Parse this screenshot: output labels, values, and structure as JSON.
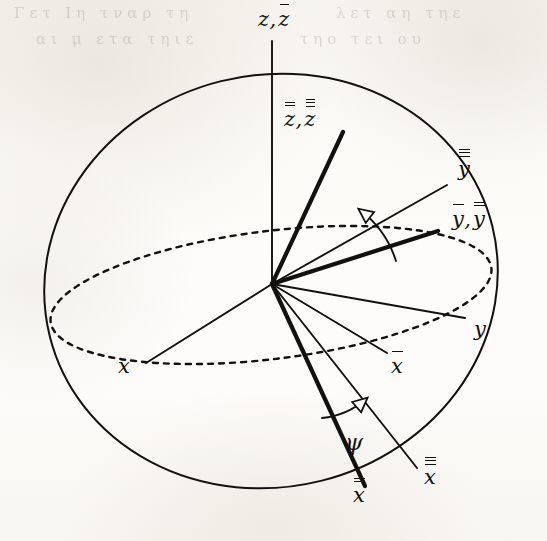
{
  "figure": {
    "kind": "euler-angle-rotation-diagram",
    "background_color": "#fbfaf7",
    "ink_color": "#13110f",
    "origin": {
      "x": 272,
      "y": 284
    },
    "sphere": {
      "center_x": 271,
      "center_y": 281,
      "radius_x": 228,
      "radius_y": 206,
      "rotation_deg": -14,
      "stroke_width": 2.0
    },
    "equator": {
      "center_x": 271,
      "center_y": 295,
      "radius_x": 222,
      "radius_y": 64,
      "rotation_deg": -7,
      "dash": "5 6",
      "stroke_width": 2.4
    },
    "axes": [
      {
        "name": "z-axis",
        "label": "z, z̄",
        "end_x": 272,
        "end_y": 41,
        "weight": "thin",
        "label_x": 258,
        "label_y": 8
      },
      {
        "name": "z-double-axis",
        "label": "z̿, z̿̄",
        "end_x": 343,
        "end_y": 132,
        "weight": "thick",
        "label_x": 284,
        "label_y": 108
      },
      {
        "name": "y-triple-axis",
        "label": "y̿̄",
        "end_x": 447,
        "end_y": 185,
        "weight": "thin",
        "label_x": 458,
        "label_y": 158
      },
      {
        "name": "y-bar-axis",
        "label": "ȳ, y̿",
        "end_x": 438,
        "end_y": 231,
        "weight": "thick",
        "label_x": 452,
        "label_y": 208
      },
      {
        "name": "y-axis",
        "label": "y",
        "end_x": 465,
        "end_y": 318,
        "weight": "thin",
        "label_x": 474,
        "label_y": 318
      },
      {
        "name": "x-bar-axis",
        "label": "x̄",
        "end_x": 387,
        "end_y": 353,
        "weight": "thin",
        "label_x": 391,
        "label_y": 355
      },
      {
        "name": "x-double-axis",
        "label": "x̿",
        "end_x": 365,
        "end_y": 486,
        "weight": "thick",
        "label_x": 353,
        "label_y": 484
      },
      {
        "name": "x-triple-axis",
        "label": "x̿̄",
        "end_x": 417,
        "end_y": 468,
        "weight": "thin",
        "label_x": 424,
        "label_y": 466
      },
      {
        "name": "x-axis",
        "label": "x",
        "end_x": 146,
        "end_y": 363,
        "weight": "thin",
        "label_x": 118,
        "label_y": 355
      }
    ],
    "angles": [
      {
        "name": "psi-upper-arc",
        "symbol": "",
        "from_x": 396,
        "from_y": 261,
        "to_x": 360,
        "to_y": 210,
        "arrow_dir": "counterclockwise"
      },
      {
        "name": "psi-lower-arc",
        "symbol": "ψ",
        "from_x": 322,
        "from_y": 418,
        "to_x": 366,
        "to_y": 399,
        "label_x": 345,
        "label_y": 431,
        "arrow_dir": "counterclockwise"
      }
    ],
    "labels": {
      "z_z_bar": {
        "base": "z",
        "bars_first": 0,
        "bars_second": 1,
        "paired": true
      },
      "z_dbl_z_tpl": {
        "base": "z",
        "bars_first": 2,
        "bars_second": 3,
        "paired": true
      },
      "y_triple": {
        "base": "y",
        "bars_first": 3,
        "paired": false
      },
      "y_bar_y_double": {
        "base": "y",
        "bars_first": 1,
        "bars_second": 2,
        "paired": true
      },
      "y_plain": {
        "base": "y",
        "bars_first": 0,
        "paired": false
      },
      "x_bar": {
        "base": "x",
        "bars_first": 1,
        "paired": false
      },
      "x_double": {
        "base": "x",
        "bars_first": 2,
        "paired": false
      },
      "x_triple": {
        "base": "x",
        "bars_first": 3,
        "paired": false
      },
      "x_plain": {
        "base": "x",
        "bars_first": 0,
        "paired": false
      },
      "psi": {
        "base": "ψ",
        "bars_first": 0,
        "paired": false
      }
    },
    "bleed_through": {
      "row_1": "Γετ Ιη τναρ τη",
      "row_2": "αι μ ετα τηιε",
      "row_3": "λετ αη τηε",
      "row_4": "τηο τει ου"
    }
  }
}
